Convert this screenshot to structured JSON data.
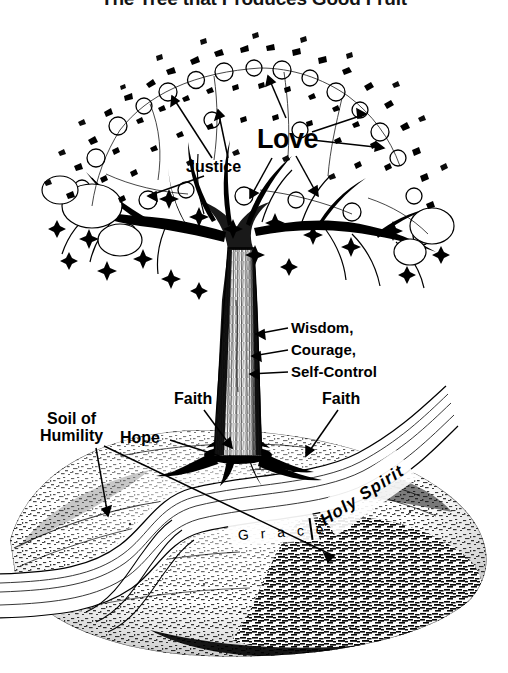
{
  "page": {
    "title": "The Tree that Produces Good Fruit",
    "background_color": "#ffffff",
    "ink_color": "#000000",
    "width": 508,
    "height": 673,
    "illustration_type": "pen-and-ink line drawing"
  },
  "labels": {
    "justice": "Justice",
    "love": "Love",
    "wisdom": "Wisdom,",
    "courage": "Courage,",
    "self_control": "Self-Control",
    "faith_left": "Faith",
    "faith_right": "Faith",
    "hope": "Hope",
    "soil_line1": "Soil of",
    "soil_line2": "Humility"
  },
  "river": {
    "left_word": "G r a c e",
    "divider": "|",
    "right_word": "Holy Spirit"
  },
  "diagram": {
    "canopy_label": "tree-canopy",
    "trunk_label": "tree-trunk",
    "roots_label": "tree-roots",
    "ground_label": "soil-mound",
    "stream_label": "grace-holy-spirit-stream"
  }
}
